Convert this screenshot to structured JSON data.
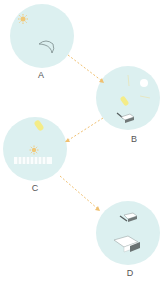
{
  "diagram": {
    "type": "sequence-flow",
    "colors": {
      "panel_fill": "#dcf0f0",
      "arrow": "#f0c070",
      "sun": "#f0c878",
      "yellow_object": "#f4ec88",
      "outline": "#7a8a8a",
      "dark_block": "#707878",
      "label": "#555555"
    },
    "panels": [
      {
        "id": "A",
        "label": "A",
        "icons": [
          "sun-icon",
          "crescent-icon"
        ]
      },
      {
        "id": "B",
        "label": "B",
        "icons": [
          "white-disc-icon",
          "yellow-capsule-icon",
          "block-icon"
        ]
      },
      {
        "id": "C",
        "label": "C",
        "icons": [
          "yellow-capsule-icon",
          "sun-icon",
          "striped-band-icon"
        ]
      },
      {
        "id": "D",
        "label": "D",
        "icons": [
          "small-block-icon",
          "large-block-icon"
        ]
      }
    ],
    "arrows": [
      {
        "from": "A",
        "to": "B",
        "style": "dashed"
      },
      {
        "from": "B",
        "to": "C",
        "style": "dashed"
      },
      {
        "from": "C",
        "to": "D",
        "style": "dashed"
      }
    ]
  }
}
